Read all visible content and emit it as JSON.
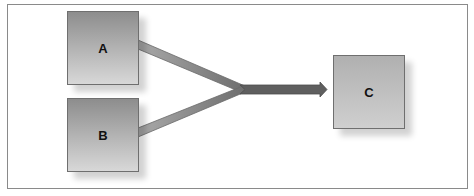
{
  "diagram": {
    "nodes": [
      {
        "id": "A",
        "label": "A"
      },
      {
        "id": "B",
        "label": "B"
      },
      {
        "id": "C",
        "label": "C"
      }
    ],
    "edges": [
      {
        "from": "A",
        "to": "C",
        "style": "merge"
      },
      {
        "from": "B",
        "to": "C",
        "style": "merge"
      }
    ],
    "colors": {
      "box_top": "#8e8e8e",
      "box_bottom": "#d6d6d6",
      "box_c": "#b8b8b8",
      "connector_light": "#9a9a9a",
      "arrow": "#5e5e5e",
      "frame": "#8a8a8a"
    }
  }
}
